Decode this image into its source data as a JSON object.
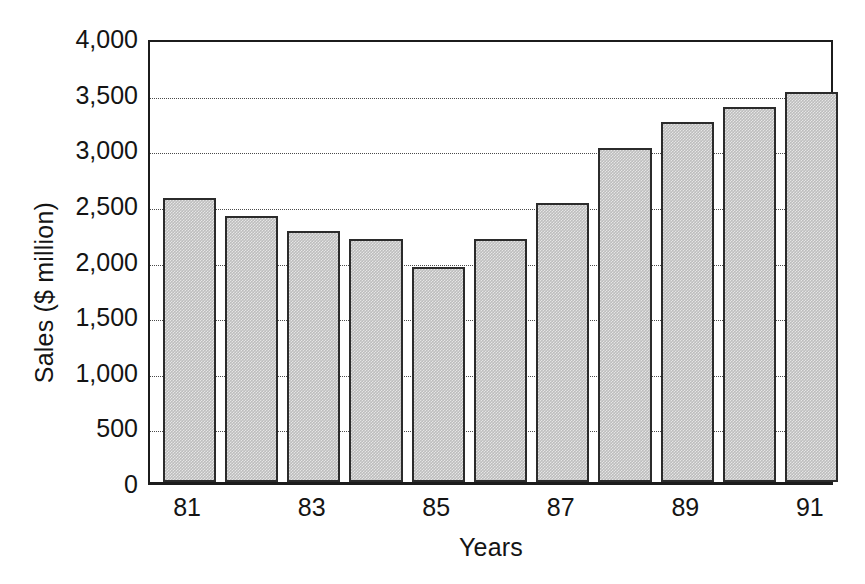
{
  "chart_data": {
    "type": "bar",
    "title": "",
    "xlabel": "Years",
    "ylabel": "Sales ($ million)",
    "categories": [
      "81",
      "82",
      "83",
      "84",
      "85",
      "86",
      "87",
      "88",
      "89",
      "90",
      "91"
    ],
    "values": [
      2550,
      2390,
      2260,
      2185,
      1935,
      2185,
      2505,
      3000,
      3235,
      3375,
      3505
    ],
    "ylim": [
      0,
      4000
    ],
    "yticks": [
      0,
      500,
      1000,
      1500,
      2000,
      2500,
      3000,
      3500,
      4000
    ],
    "ytick_labels": [
      "0",
      "500",
      "1,000",
      "1,500",
      "2,000",
      "2,500",
      "3,000",
      "3,500",
      "4,000"
    ],
    "xtick_labels": [
      "81",
      "83",
      "85",
      "87",
      "89",
      "91"
    ],
    "xtick_indices": [
      0,
      2,
      4,
      6,
      8,
      10
    ],
    "grid": "horizontal-dotted",
    "legend": "none",
    "bar_fill_color": "#bdbdbd",
    "bar_edge_color": "#2b2b2b",
    "axis_color": "#1c1c1c",
    "background_color": "#ffffff"
  },
  "axes": {
    "y_title": "Sales ($ million)",
    "x_title": "Years"
  }
}
